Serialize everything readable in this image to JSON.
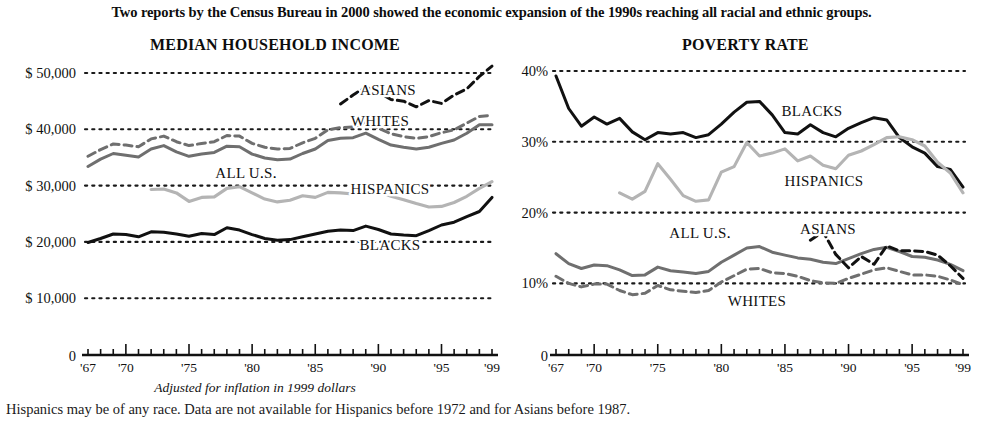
{
  "headline": "Two reports by the Census Bureau in 2000 showed the economic expansion of the 1990s reaching all racial and ethnic groups.",
  "axis_note": "Adjusted for inflation in 1999 dollars",
  "footnote": "Hispanics may be of any race. Data are not available for Hispanics before 1972 and for Asians before 1987.",
  "panels": {
    "left": {
      "title": "MEDIAN HOUSEHOLD INCOME"
    },
    "right": {
      "title": "POVERTY RATE"
    }
  },
  "colors": {
    "black": "#111111",
    "dark_gray": "#6f6f6f",
    "light_gray": "#b4b4b4",
    "dotted_grid": "#1a1a1a",
    "background": "#ffffff"
  },
  "chart_data": [
    {
      "type": "line",
      "title": "MEDIAN HOUSEHOLD INCOME",
      "xlabel": "",
      "ylabel": "",
      "note": "Adjusted for inflation in 1999 dollars",
      "grid": true,
      "legend": "inline-labels",
      "xlim": [
        1967,
        1999
      ],
      "ylim": [
        0,
        50000
      ],
      "yticks": [
        50000,
        40000,
        30000,
        20000,
        10000,
        0
      ],
      "ytick_labels": [
        "$ 50,000",
        "$ 40,000",
        "$ 30,000",
        "$ 20,000",
        "$ 10,000",
        "0"
      ],
      "xticks": [
        1967,
        1970,
        1975,
        1980,
        1985,
        1990,
        1995,
        1999
      ],
      "xtick_labels": [
        "'67",
        "'70",
        "'75",
        "'80",
        "'85",
        "'90",
        "'95",
        "'99"
      ],
      "series": [
        {
          "name": "ASIANS",
          "style": "dashed",
          "color": "#111111",
          "x": [
            1987,
            1988,
            1989,
            1990,
            1991,
            1992,
            1993,
            1994,
            1995,
            1996,
            1997,
            1998,
            1999
          ],
          "values": [
            44500,
            46100,
            47500,
            46600,
            45300,
            45000,
            44000,
            45100,
            44600,
            46100,
            47200,
            49400,
            51200
          ]
        },
        {
          "name": "WHITES",
          "style": "dashed",
          "color": "#6f6f6f",
          "x": [
            1967,
            1968,
            1969,
            1970,
            1971,
            1972,
            1973,
            1974,
            1975,
            1976,
            1977,
            1978,
            1979,
            1980,
            1981,
            1982,
            1983,
            1984,
            1985,
            1986,
            1987,
            1988,
            1989,
            1990,
            1991,
            1992,
            1993,
            1994,
            1995,
            1996,
            1997,
            1998,
            1999
          ],
          "values": [
            35200,
            36400,
            37400,
            37200,
            36900,
            38300,
            38800,
            37800,
            37100,
            37500,
            37800,
            38900,
            38800,
            37500,
            36800,
            36500,
            36600,
            37600,
            38400,
            39900,
            40300,
            40400,
            41200,
            40200,
            39200,
            38700,
            38400,
            38700,
            39400,
            39900,
            41100,
            42300,
            42500
          ]
        },
        {
          "name": "ALL U.S.",
          "style": "solid",
          "color": "#6f6f6f",
          "x": [
            1967,
            1968,
            1969,
            1970,
            1971,
            1972,
            1973,
            1974,
            1975,
            1976,
            1977,
            1978,
            1979,
            1980,
            1981,
            1982,
            1983,
            1984,
            1985,
            1986,
            1987,
            1988,
            1989,
            1990,
            1991,
            1992,
            1993,
            1994,
            1995,
            1996,
            1997,
            1998,
            1999
          ],
          "values": [
            33400,
            34700,
            35700,
            35400,
            35100,
            36500,
            37100,
            36000,
            35200,
            35600,
            35900,
            37000,
            36900,
            35600,
            34900,
            34600,
            34700,
            35700,
            36500,
            38000,
            38400,
            38500,
            39300,
            38200,
            37200,
            36800,
            36500,
            36800,
            37500,
            38100,
            39300,
            40800,
            40800
          ]
        },
        {
          "name": "HISPANICS",
          "style": "solid",
          "color": "#b4b4b4",
          "x": [
            1972,
            1973,
            1974,
            1975,
            1976,
            1977,
            1978,
            1979,
            1980,
            1981,
            1982,
            1983,
            1984,
            1985,
            1986,
            1987,
            1988,
            1989,
            1990,
            1991,
            1992,
            1993,
            1994,
            1995,
            1996,
            1997,
            1998,
            1999
          ],
          "values": [
            29300,
            29400,
            28700,
            27200,
            27900,
            28000,
            29500,
            29800,
            28700,
            27600,
            27100,
            27400,
            28200,
            27900,
            28800,
            28700,
            28500,
            29600,
            29000,
            28100,
            27500,
            26800,
            26200,
            26300,
            27000,
            28100,
            29500,
            30700
          ]
        },
        {
          "name": "BLACKS",
          "style": "solid",
          "color": "#111111",
          "x": [
            1967,
            1968,
            1969,
            1970,
            1971,
            1972,
            1973,
            1974,
            1975,
            1976,
            1977,
            1978,
            1979,
            1980,
            1981,
            1982,
            1983,
            1984,
            1985,
            1986,
            1987,
            1988,
            1989,
            1990,
            1991,
            1992,
            1993,
            1994,
            1995,
            1996,
            1997,
            1998,
            1999
          ],
          "values": [
            19900,
            20600,
            21400,
            21300,
            20900,
            21800,
            21700,
            21400,
            21000,
            21500,
            21300,
            22500,
            22100,
            21300,
            20600,
            20300,
            20400,
            20900,
            21400,
            21900,
            22100,
            22000,
            22800,
            22200,
            21400,
            21200,
            21100,
            22000,
            23000,
            23500,
            24500,
            25400,
            27900
          ]
        }
      ]
    },
    {
      "type": "line",
      "title": "POVERTY RATE",
      "xlabel": "",
      "ylabel": "",
      "grid": true,
      "legend": "inline-labels",
      "xlim": [
        1967,
        1999
      ],
      "ylim": [
        0,
        40
      ],
      "yticks": [
        40,
        30,
        20,
        10,
        0
      ],
      "ytick_labels": [
        "40%",
        "30%",
        "20%",
        "10%",
        "0"
      ],
      "xticks": [
        1967,
        1970,
        1975,
        1980,
        1985,
        1990,
        1995,
        1999
      ],
      "xtick_labels": [
        "'67",
        "'70",
        "'75",
        "'80",
        "'85",
        "'90",
        "'95",
        "'99"
      ],
      "series": [
        {
          "name": "BLACKS",
          "style": "solid",
          "color": "#111111",
          "x": [
            1967,
            1968,
            1969,
            1970,
            1971,
            1972,
            1973,
            1974,
            1975,
            1976,
            1977,
            1978,
            1979,
            1980,
            1981,
            1982,
            1983,
            1984,
            1985,
            1986,
            1987,
            1988,
            1989,
            1990,
            1991,
            1992,
            1993,
            1994,
            1995,
            1996,
            1997,
            1998,
            1999
          ],
          "values": [
            39.3,
            34.7,
            32.2,
            33.5,
            32.5,
            33.3,
            31.4,
            30.3,
            31.3,
            31.1,
            31.3,
            30.6,
            31.0,
            32.5,
            34.2,
            35.6,
            35.7,
            33.8,
            31.3,
            31.1,
            32.4,
            31.3,
            30.7,
            31.9,
            32.7,
            33.4,
            33.1,
            30.6,
            29.3,
            28.4,
            26.5,
            26.1,
            23.6
          ]
        },
        {
          "name": "HISPANICS",
          "style": "solid",
          "color": "#b4b4b4",
          "x": [
            1972,
            1973,
            1974,
            1975,
            1976,
            1977,
            1978,
            1979,
            1980,
            1981,
            1982,
            1983,
            1984,
            1985,
            1986,
            1987,
            1988,
            1989,
            1990,
            1991,
            1992,
            1993,
            1994,
            1995,
            1996,
            1997,
            1998,
            1999
          ],
          "values": [
            22.8,
            21.9,
            23.0,
            26.9,
            24.7,
            22.4,
            21.6,
            21.8,
            25.7,
            26.5,
            29.9,
            28.0,
            28.4,
            29.0,
            27.3,
            28.0,
            26.7,
            26.2,
            28.1,
            28.7,
            29.6,
            30.6,
            30.7,
            30.3,
            29.4,
            27.1,
            25.6,
            22.8
          ]
        },
        {
          "name": "ALL U.S.",
          "style": "solid",
          "color": "#6f6f6f",
          "x": [
            1967,
            1968,
            1969,
            1970,
            1971,
            1972,
            1973,
            1974,
            1975,
            1976,
            1977,
            1978,
            1979,
            1980,
            1981,
            1982,
            1983,
            1984,
            1985,
            1986,
            1987,
            1988,
            1989,
            1990,
            1991,
            1992,
            1993,
            1994,
            1995,
            1996,
            1997,
            1998,
            1999
          ],
          "values": [
            14.2,
            12.8,
            12.1,
            12.6,
            12.5,
            11.9,
            11.1,
            11.2,
            12.3,
            11.8,
            11.6,
            11.4,
            11.7,
            13.0,
            14.0,
            15.0,
            15.2,
            14.4,
            14.0,
            13.6,
            13.4,
            13.0,
            12.8,
            13.5,
            14.2,
            14.8,
            15.1,
            14.5,
            13.8,
            13.7,
            13.3,
            12.7,
            11.8
          ]
        },
        {
          "name": "ASIANS",
          "style": "dashed",
          "color": "#111111",
          "x": [
            1987,
            1988,
            1989,
            1990,
            1991,
            1992,
            1993,
            1994,
            1995,
            1996,
            1997,
            1998,
            1999
          ],
          "values": [
            16.1,
            17.3,
            14.1,
            12.2,
            13.8,
            12.7,
            15.3,
            14.6,
            14.6,
            14.5,
            14.0,
            12.5,
            10.7
          ]
        },
        {
          "name": "WHITES",
          "style": "dashed",
          "color": "#6f6f6f",
          "x": [
            1967,
            1968,
            1969,
            1970,
            1971,
            1972,
            1973,
            1974,
            1975,
            1976,
            1977,
            1978,
            1979,
            1980,
            1981,
            1982,
            1983,
            1984,
            1985,
            1986,
            1987,
            1988,
            1989,
            1990,
            1991,
            1992,
            1993,
            1994,
            1995,
            1996,
            1997,
            1998,
            1999
          ],
          "values": [
            11.0,
            10.0,
            9.5,
            9.9,
            9.9,
            9.0,
            8.4,
            8.6,
            9.7,
            9.1,
            8.9,
            8.7,
            9.0,
            10.2,
            11.1,
            12.0,
            12.1,
            11.5,
            11.4,
            11.0,
            10.4,
            10.1,
            10.0,
            10.7,
            11.3,
            11.9,
            12.2,
            11.7,
            11.2,
            11.2,
            11.0,
            10.5,
            9.8
          ]
        }
      ]
    }
  ],
  "series_labels": {
    "left": [
      {
        "text": "ASIANS",
        "x": 388,
        "y": 95
      },
      {
        "text": "WHITES",
        "x": 380,
        "y": 126
      },
      {
        "text": "ALL U.S.",
        "x": 246,
        "y": 178
      },
      {
        "text": "HISPANICS",
        "x": 390,
        "y": 194
      },
      {
        "text": "BLACKS",
        "x": 390,
        "y": 250
      }
    ],
    "right": [
      {
        "text": "BLACKS",
        "x": 812,
        "y": 116
      },
      {
        "text": "HISPANICS",
        "x": 824,
        "y": 186
      },
      {
        "text": "ALL U.S.",
        "x": 700,
        "y": 238
      },
      {
        "text": "ASIANS",
        "x": 828,
        "y": 234
      },
      {
        "text": "WHITES",
        "x": 757,
        "y": 306
      }
    ]
  }
}
